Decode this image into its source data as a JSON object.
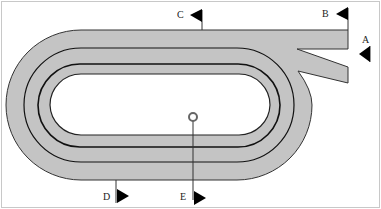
{
  "diagram": {
    "type": "racetrack",
    "colors": {
      "track_fill": "#c4c4c4",
      "track_edge": "#333333",
      "lane_line": "#111111",
      "flag": "#000000",
      "background": "#ffffff",
      "border": "#bbbbbb"
    },
    "markers": [
      {
        "id": "A",
        "label": "A"
      },
      {
        "id": "B",
        "label": "B"
      },
      {
        "id": "C",
        "label": "C"
      },
      {
        "id": "D",
        "label": "D"
      },
      {
        "id": "E",
        "label": "E"
      }
    ]
  }
}
